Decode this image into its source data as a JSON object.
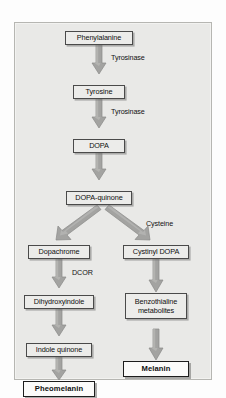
{
  "figure": {
    "background_color": "#e9e9e7",
    "frame_color": "#b6b6b2",
    "arrow_color": "#9e9e9c",
    "node_fill": "#ececea",
    "terminal_fill": "#fbfbfa"
  },
  "diagram": {
    "type": "flowchart",
    "nodes": [
      {
        "id": "phenylalanine",
        "label": "Phenylalanine",
        "kind": "intermediate",
        "column": "center"
      },
      {
        "id": "tyrosine",
        "label": "Tyrosine",
        "kind": "intermediate",
        "column": "center"
      },
      {
        "id": "dopa",
        "label": "DOPA",
        "kind": "intermediate",
        "column": "center"
      },
      {
        "id": "dopa-quinone",
        "label": "DOPA-quinone",
        "kind": "intermediate",
        "column": "center"
      },
      {
        "id": "dopachrome",
        "label": "Dopachrome",
        "kind": "intermediate",
        "column": "left"
      },
      {
        "id": "dihydroxyindole",
        "label": "Dihydroxyindole",
        "kind": "intermediate",
        "column": "left"
      },
      {
        "id": "indole-quinone",
        "label": "Indole quinone",
        "kind": "intermediate",
        "column": "left"
      },
      {
        "id": "pheomelanin",
        "label": "Pheomelanin",
        "kind": "terminal",
        "column": "left"
      },
      {
        "id": "cystinyl-dopa",
        "label": "Cystinyl DOPA",
        "kind": "intermediate",
        "column": "right"
      },
      {
        "id": "benzothialine-1",
        "label": "Benzothialine",
        "kind": "intermediate",
        "column": "right"
      },
      {
        "id": "benzothialine-2",
        "label": "metabolites",
        "kind": "intermediate",
        "column": "right"
      },
      {
        "id": "melanin",
        "label": "Melanin",
        "kind": "terminal",
        "column": "right"
      }
    ],
    "edge_labels": [
      {
        "id": "tyrosinase-1",
        "label": "Tyrosinase"
      },
      {
        "id": "tyrosinase-2",
        "label": "Tyrosinase"
      },
      {
        "id": "cysteine",
        "label": "Cysteine"
      },
      {
        "id": "dcor",
        "label": "DCOR"
      }
    ],
    "edges": [
      {
        "from": "phenylalanine",
        "to": "tyrosine",
        "label": "Tyrosinase",
        "shape": "vertical"
      },
      {
        "from": "tyrosine",
        "to": "dopa",
        "label": "Tyrosinase",
        "shape": "vertical"
      },
      {
        "from": "dopa",
        "to": "dopa-quinone",
        "label": "",
        "shape": "vertical"
      },
      {
        "from": "dopa-quinone",
        "to": "dopachrome",
        "label": "",
        "shape": "diagonal-left"
      },
      {
        "from": "dopa-quinone",
        "to": "cystinyl-dopa",
        "label": "Cysteine",
        "shape": "diagonal-right"
      },
      {
        "from": "dopachrome",
        "to": "dihydroxyindole",
        "label": "DCOR",
        "shape": "vertical"
      },
      {
        "from": "dihydroxyindole",
        "to": "indole-quinone",
        "label": "",
        "shape": "vertical"
      },
      {
        "from": "indole-quinone",
        "to": "pheomelanin",
        "label": "",
        "shape": "vertical"
      },
      {
        "from": "cystinyl-dopa",
        "to": "benzothialine-1",
        "label": "",
        "shape": "vertical"
      },
      {
        "from": "benzothialine-1",
        "to": "melanin",
        "label": "",
        "shape": "vertical"
      }
    ]
  }
}
